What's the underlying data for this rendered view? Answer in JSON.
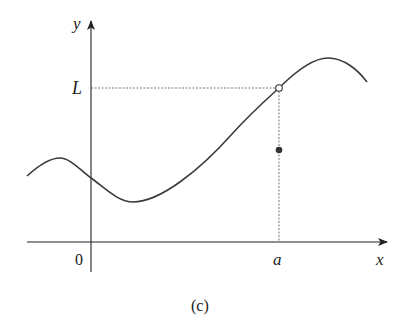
{
  "figure": {
    "caption": "(c)",
    "axes": {
      "x_label": "x",
      "y_label": "y",
      "origin_label": "0"
    },
    "marks": {
      "limit_label": "L",
      "point_label": "a"
    },
    "colors": {
      "curve": "#3a3a3a",
      "axes": "#222222",
      "dashed": "#777777",
      "background": "#ffffff"
    },
    "points": {
      "open_circle": {
        "x": "a",
        "y": "L",
        "filled": false
      },
      "filled_dot": {
        "x": "a",
        "y": "f(a)",
        "filled": true
      }
    }
  }
}
